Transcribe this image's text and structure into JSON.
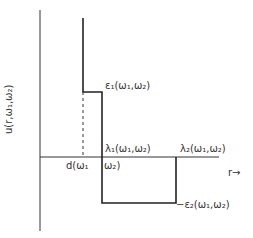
{
  "diagram": {
    "y_axis_label": "u(r,ω₁,ω₂)",
    "x_axis_label": "r→",
    "labels": {
      "epsilon1": "ε₁(ω₁,ω₂)",
      "lambda1": "λ₁(ω₁,ω₂)",
      "lambda2": "λ₂(ω₁,ω₂)",
      "d": "d(ω₁",
      "d_tail": "ω₂)",
      "neg_epsilon2": "−ε₂(ω₁,ω₂)"
    }
  }
}
